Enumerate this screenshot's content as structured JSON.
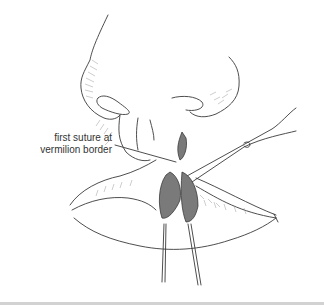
{
  "figure": {
    "annotations": [
      {
        "line1": "first suture at",
        "line2": "vermilion border"
      }
    ]
  },
  "colors": {
    "line": "#3a3a3a",
    "hatch": "#9a9a9a",
    "tissue_fill": "#7a7a7a",
    "background": "#ffffff",
    "bottom_rule": "#d2d2d2"
  }
}
